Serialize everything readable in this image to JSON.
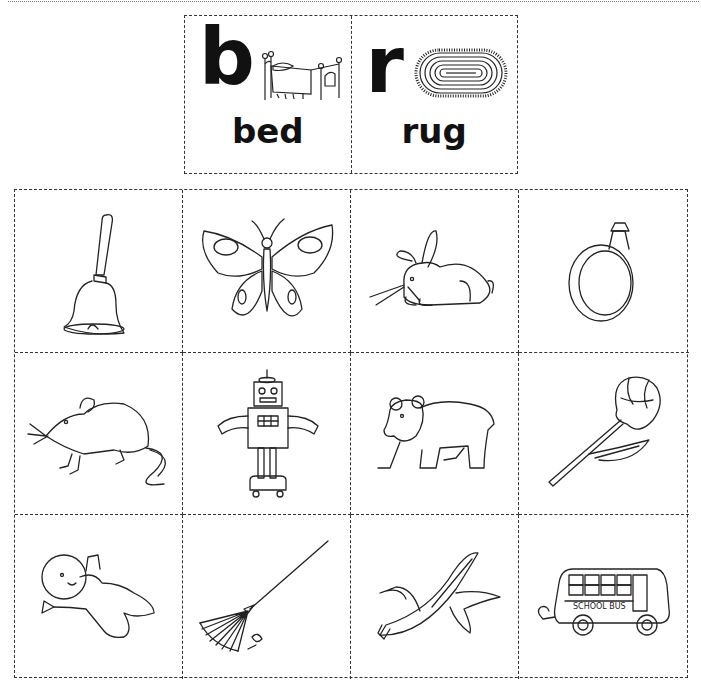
{
  "worksheet": {
    "header": {
      "cards": [
        {
          "letter": "b",
          "keyword": "bed",
          "picture": "bed-picture"
        },
        {
          "letter": "r",
          "keyword": "rug",
          "picture": "rug-picture"
        }
      ]
    },
    "picture_grid": {
      "columns": 4,
      "rows": 3,
      "items": [
        {
          "name": "bell"
        },
        {
          "name": "butterfly"
        },
        {
          "name": "rabbit"
        },
        {
          "name": "ring"
        },
        {
          "name": "rat"
        },
        {
          "name": "robot"
        },
        {
          "name": "bear"
        },
        {
          "name": "rose"
        },
        {
          "name": "baby"
        },
        {
          "name": "rake"
        },
        {
          "name": "banana"
        },
        {
          "name": "bus",
          "sign_text": "SCHOOL BUS"
        }
      ]
    },
    "colors": {
      "line": "#222222",
      "background": "#ffffff",
      "dashed_border": "#333333"
    }
  }
}
